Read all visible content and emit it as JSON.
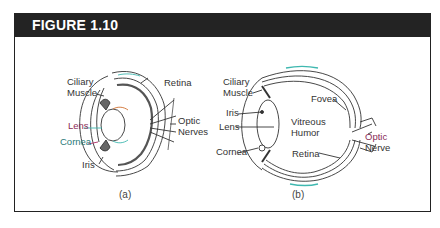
{
  "figure": {
    "title": "FIGURE 1.10",
    "colors": {
      "header_bg": "#232323",
      "header_text": "#ffffff",
      "line": "#333333",
      "accent_pink": "#b0306a",
      "accent_teal": "#3fb8b0"
    },
    "panels": [
      {
        "id": "a",
        "caption": "(a)",
        "labels": {
          "ciliary_muscle_1": "Ciliary",
          "ciliary_muscle_2": "Muscle",
          "retina": "Retina",
          "lens": "Lens",
          "optic_nerves_1": "Optic",
          "optic_nerves_2": "Nerves",
          "cornea": "Cornea",
          "iris": "Iris"
        }
      },
      {
        "id": "b",
        "caption": "(b)",
        "labels": {
          "ciliary_muscle_1": "Ciliary",
          "ciliary_muscle_2": "Muscle",
          "iris": "Iris",
          "fovea": "Fovea",
          "vitreous_humor_1": "Vitreous",
          "vitreous_humor_2": "Humor",
          "lens": "Lens",
          "optic_nerve_1": "Optic",
          "optic_nerve_2": "Nerve",
          "cornea": "Cornea",
          "retina": "Retina"
        }
      }
    ]
  }
}
